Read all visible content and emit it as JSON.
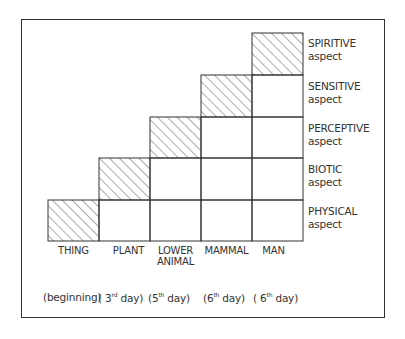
{
  "diagram": {
    "type": "staircase-grid",
    "rows": [
      {
        "aspect": "SPIRITIVE",
        "sub": "aspect"
      },
      {
        "aspect": "SENSITIVE",
        "sub": "aspect"
      },
      {
        "aspect": "PERCEPTIVE",
        "sub": "aspect"
      },
      {
        "aspect": "BIOTIC",
        "sub": "aspect"
      },
      {
        "aspect": "PHYSICAL",
        "sub": "aspect"
      }
    ],
    "columns": [
      {
        "name": "THING",
        "name2": "",
        "day_open": "(beginning)",
        "day_num": "",
        "day_sup": "",
        "day_rest": ""
      },
      {
        "name": "PLANT",
        "name2": "",
        "day_open": "( 3",
        "day_num": "",
        "day_sup": "rd",
        "day_rest": " day)"
      },
      {
        "name": "LOWER",
        "name2": "ANIMAL",
        "day_open": "(5",
        "day_num": "",
        "day_sup": "th",
        "day_rest": " day)"
      },
      {
        "name": "MAMMAL",
        "name2": "",
        "day_open": "(6",
        "day_num": "",
        "day_sup": "th",
        "day_rest": " day)"
      },
      {
        "name": "MAN",
        "name2": "",
        "day_open": "( 6",
        "day_num": "",
        "day_sup": "th",
        "day_rest": " day)"
      }
    ],
    "hatched_cells_note": "Each column's highest aspect is hatched: THING-PHYSICAL, PLANT-BIOTIC, LOWER ANIMAL-PERCEPTIVE, MAMMAL-SENSITIVE, MAN-SPIRITIVE"
  }
}
